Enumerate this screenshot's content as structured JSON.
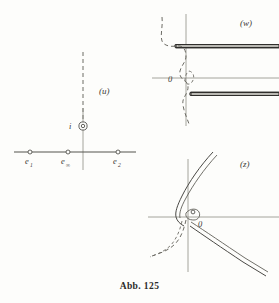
{
  "figure": {
    "caption": "Abb. 125",
    "planes": [
      {
        "id": "u",
        "label": "(u)"
      },
      {
        "id": "w",
        "label": "(w)"
      },
      {
        "id": "z",
        "label": "(z)"
      }
    ]
  },
  "plane_u": {
    "label": "(u)",
    "points": [
      {
        "name": "e1",
        "label": "e",
        "subscript": "1",
        "x": 30,
        "y": 152
      },
      {
        "name": "einf",
        "label": "e",
        "subscript": "∞",
        "x": 68,
        "y": 152
      },
      {
        "name": "e2",
        "label": "e",
        "subscript": "2",
        "x": 118,
        "y": 152
      },
      {
        "name": "i",
        "label": "i",
        "subscript": "",
        "x": 83,
        "y": 126
      }
    ],
    "axis_real": {
      "x1": 14,
      "x2": 136,
      "y": 152
    },
    "axis_imag": {
      "x": 83,
      "y1": 108,
      "y2": 170
    },
    "cut_ray": {
      "x": 83,
      "y_top": 52,
      "y_bottom": 126,
      "style": "dashed"
    }
  },
  "plane_w": {
    "label": "(w)",
    "label_pos": {
      "x": 246,
      "y": 25
    },
    "origin_label": "0",
    "origin_label_pos": {
      "x": 171,
      "y": 81
    },
    "axis_real": {
      "x1": 152,
      "x2": 279,
      "y": 78
    },
    "axis_imag": {
      "x": 186,
      "y1": 14,
      "y2": 126
    },
    "slits": [
      {
        "name": "upper-slit",
        "x1": 175,
        "x2": 279,
        "y": 46,
        "thickness": 3
      },
      {
        "name": "lower-slit",
        "x1": 190,
        "x2": 279,
        "y": 94,
        "thickness": 3
      }
    ],
    "dashed_curve": "s-shaped boundary curve"
  },
  "plane_z": {
    "label": "(z)",
    "label_pos": {
      "x": 246,
      "y": 165
    },
    "origin_label": "0",
    "origin_label_pos": {
      "x": 196,
      "y": 225
    },
    "axis_real": {
      "x1": 148,
      "x2": 279,
      "y": 217
    },
    "axis_imag": {
      "x": 188,
      "y1": 160,
      "y2": 272
    },
    "curves": [
      {
        "name": "upper-branch",
        "style": "double-line"
      },
      {
        "name": "lower-branch",
        "style": "double-line"
      },
      {
        "name": "loop",
        "style": "small-loop-at-origin"
      },
      {
        "name": "dashed-branch",
        "style": "dashed"
      }
    ]
  },
  "colors": {
    "ink": "#3b3a36",
    "axis": "#8d8d86",
    "slit_fill": "#b9b8b2",
    "paper": "#fdfdfb",
    "dash": "#6d6c65"
  }
}
